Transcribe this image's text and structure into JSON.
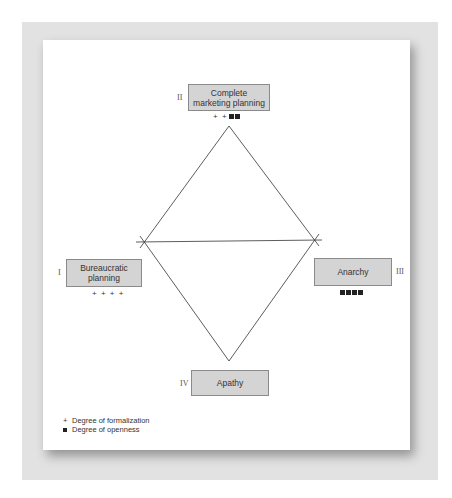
{
  "diagram": {
    "nodes": [
      {
        "id": "I",
        "roman": "I",
        "label": "Bureaucratic planning",
        "formalization": "+ + + +",
        "openness_count": 0
      },
      {
        "id": "II",
        "roman": "II",
        "label": "Complete marketing planning",
        "formalization": "+ +",
        "openness_count": 2
      },
      {
        "id": "III",
        "roman": "III",
        "label": "Anarchy",
        "formalization": "",
        "openness_count": 4
      },
      {
        "id": "IV",
        "roman": "IV",
        "label": "Apathy",
        "formalization": "",
        "openness_count": 0
      }
    ],
    "legend": [
      {
        "symbol": "+",
        "label": "Degree of formalization"
      },
      {
        "symbol": "■",
        "label": "Degree of openness"
      }
    ],
    "colors": {
      "box_fill": "#d4d4d4",
      "box_border": "#8a8a8a",
      "line": "#333333",
      "frame": "#e2e2e2"
    }
  }
}
